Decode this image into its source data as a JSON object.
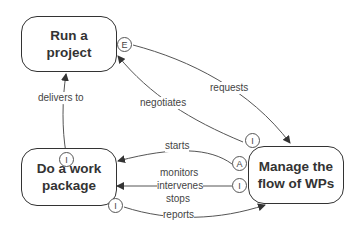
{
  "nodes": {
    "run_project": {
      "label": "Run a\nproject",
      "line1": "Run a",
      "line2": "project"
    },
    "do_work_package": {
      "line1": "Do a work",
      "line2": "package"
    },
    "manage_flow": {
      "line1": "Manage the",
      "line2": "flow of WPs"
    }
  },
  "ports": {
    "run_project_e": "E",
    "do_wp_top_i": "I",
    "do_wp_bottom_i": "I",
    "manage_top_i": "I",
    "manage_a": "A",
    "manage_mid_i": "I"
  },
  "edges": {
    "delivers_to": "delivers to",
    "negotiates": "negotiates",
    "requests": "requests",
    "starts": "starts",
    "monitors": "monitors",
    "intervenes": "intervenes",
    "stops": "stops",
    "reports": "reports"
  }
}
